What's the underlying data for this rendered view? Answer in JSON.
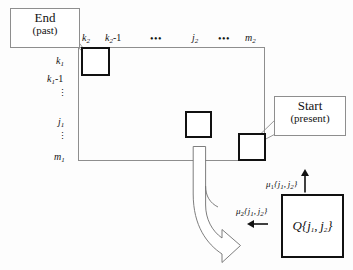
{
  "figure": {
    "background_color": "#fdfdfd",
    "line_color": "#8e8e8e",
    "cell_border_color": "#111111"
  },
  "callouts": {
    "end": {
      "line1": "End",
      "line2": "(past)",
      "name": "end-past-callout"
    },
    "start": {
      "line1": "Start",
      "line2": "(present)",
      "name": "start-present-callout"
    }
  },
  "axes": {
    "top_labels": [
      {
        "base": "k",
        "sub": "2",
        "suffix": "",
        "x": 81
      },
      {
        "base": "k",
        "sub": "2",
        "suffix": "-1",
        "x": 104
      },
      {
        "base": "",
        "sub": "",
        "suffix": "",
        "x": 150
      },
      {
        "base": "j",
        "sub": "2",
        "suffix": "",
        "x": 192
      },
      {
        "base": "",
        "sub": "",
        "suffix": "",
        "x": 219
      },
      {
        "base": "m",
        "sub": "2",
        "suffix": "",
        "x": 246
      }
    ],
    "top_label_texts": [
      "k₂",
      "k₂-1",
      "⋯",
      "j₂",
      "⋯",
      "m₂"
    ],
    "left_label_texts": [
      "k₁",
      "k₁-1",
      "⋮",
      "j₁",
      "⋮",
      "m₁"
    ],
    "top_ellipsis": "•••",
    "left_ellipsis": "⋮"
  },
  "labels": {
    "k2": "k",
    "k2_sub": "2",
    "k2_minus1": "k",
    "k2_minus1_sub": "2",
    "k2_minus1_suffix": "-1",
    "j2": "j",
    "j2_sub": "2",
    "m2": "m",
    "m2_sub": "2",
    "k1": "k",
    "k1_sub": "1",
    "k1_minus1": "k",
    "k1_minus1_sub": "1",
    "k1_minus1_suffix": "-1",
    "j1": "j",
    "j1_sub": "1",
    "m1": "m",
    "m1_sub": "1"
  },
  "cells": {
    "end_cell": {
      "name": "end-state-cell",
      "x": 81,
      "y": 47,
      "w": 29,
      "h": 29
    },
    "middle_cell": {
      "name": "intermediate-state-cell",
      "x": 185,
      "y": 111,
      "w": 27,
      "h": 27
    },
    "start_cell": {
      "name": "start-state-cell",
      "x": 238,
      "y": 133,
      "w": 28,
      "h": 28
    }
  },
  "grid": {
    "x": 78,
    "y": 47,
    "w": 187,
    "h": 114
  },
  "transitions": {
    "mu1": {
      "symbol": "μ",
      "sub": "1",
      "args": "{j₁, j₂}",
      "arg_j1": "j",
      "arg_j1_sub": "1",
      "arg_j2": "j",
      "arg_j2_sub": "2",
      "arrow_direction": "up",
      "arrow_glyph": "↑",
      "name": "mu1-transition-label"
    },
    "mu2": {
      "symbol": "μ",
      "sub": "2",
      "args": "{j₁, j₂}",
      "arg_j1": "j",
      "arg_j1_sub": "1",
      "arg_j2": "j",
      "arg_j2_sub": "2",
      "arrow_direction": "left",
      "arrow_glyph": "←",
      "name": "mu2-transition-label"
    }
  },
  "q_box": {
    "symbol": "Q",
    "args": "{j₁, j₂}",
    "arg_j1": "j",
    "arg_j1_sub": "1",
    "arg_j2": "j",
    "arg_j2_sub": "2",
    "name": "q-state-box"
  },
  "big_arrow": {
    "name": "backtrack-arrow",
    "description": "curved hook arrow from grid bottom pointing down-right"
  }
}
